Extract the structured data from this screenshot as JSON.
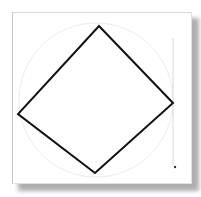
{
  "figure": {
    "colors": {
      "shape_stroke": "#111111",
      "guide_stroke": "#d8d8d8",
      "background": "#ffffff",
      "shadow": "#9a9a9a"
    },
    "diamond": {
      "vertices": [
        [
          99,
          26
        ],
        [
          173,
          103
        ],
        [
          95,
          173
        ],
        [
          18,
          114
        ]
      ],
      "stroke_width": 2
    },
    "guide_circle": {
      "cx": 96,
      "cy": 100,
      "r": 77
    },
    "guide_line": {
      "x": 173,
      "y1": 38,
      "y2": 165
    },
    "endpoint_marker": {
      "x": 175,
      "y": 167
    }
  }
}
